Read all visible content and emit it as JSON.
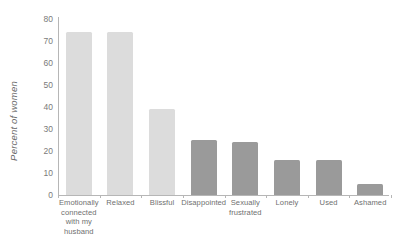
{
  "chart_data": {
    "type": "bar",
    "title": "",
    "subtitle": "",
    "xlabel": "",
    "ylabel": "Percent of women",
    "ylim": [
      0,
      80
    ],
    "yticks": [
      0,
      10,
      20,
      30,
      40,
      50,
      60,
      70,
      80
    ],
    "ytick_labels": [
      "0",
      "10",
      "20",
      "30",
      "40",
      "50",
      "60",
      "70",
      "80"
    ],
    "grid": false,
    "legend": "none",
    "categories": [
      "Emotionally connected with my husband",
      "Relaxed",
      "Blissful",
      "Disappointed",
      "Sexually frustrated",
      "Lonely",
      "Used",
      "Ashamed"
    ],
    "category_lines": [
      [
        "Emotionally",
        "connected",
        "with my",
        "husband"
      ],
      [
        "Relaxed"
      ],
      [
        "Blissful"
      ],
      [
        "Disappointed"
      ],
      [
        "Sexually",
        "frustrated"
      ],
      [
        "Lonely"
      ],
      [
        "Used"
      ],
      [
        "Ashamed"
      ]
    ],
    "values": [
      74,
      74,
      39,
      25,
      24,
      16,
      16,
      5
    ],
    "bar_colors": [
      "#dcdcdc",
      "#dcdcdc",
      "#dcdcdc",
      "#9a9a9a",
      "#9a9a9a",
      "#9a9a9a",
      "#9a9a9a",
      "#9a9a9a"
    ]
  },
  "colors": {
    "positive_bar": "#dcdcdc",
    "negative_bar": "#9a9a9a",
    "axis": "#b6b6b6",
    "tick_text": "#7a7a7a",
    "label_text": "#6f6f6f",
    "background": "#ffffff"
  }
}
